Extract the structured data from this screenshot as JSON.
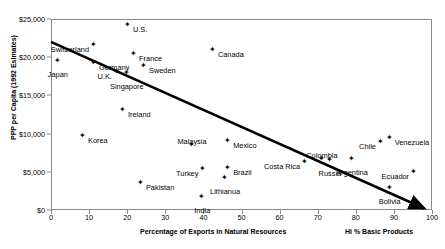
{
  "chart_data": {
    "type": "scatter",
    "title": "",
    "xlabel": "Percentage of Exports in Natural Resources",
    "ylabel": "PPP per Capita (1992 Esimates)",
    "xlim": [
      0,
      100
    ],
    "ylim": [
      0,
      25000
    ],
    "xticks": [
      0,
      10,
      20,
      30,
      40,
      50,
      60,
      70,
      80,
      90,
      100
    ],
    "xtick_labels": [
      "0",
      "10",
      "20",
      "30",
      "40",
      "50",
      "60",
      "70",
      "80",
      "90",
      "100"
    ],
    "yticks": [
      0,
      5000,
      10000,
      15000,
      20000,
      25000
    ],
    "ytick_labels": [
      "$0",
      "$5,000",
      "$10,000",
      "$15,000",
      "$20,000",
      "$25,000"
    ],
    "grid": false,
    "legend": null,
    "annotations": [
      {
        "name": "hi-basic-products-note",
        "text": "Hi % Basic Products",
        "x": 92,
        "y": -2300
      }
    ],
    "trendline": {
      "type": "line-with-arrow",
      "x0": 0,
      "y0": 22000,
      "x1": 98,
      "y1": 200,
      "color": "#000000",
      "width": 2.6
    },
    "points": [
      {
        "label": "Switzerland",
        "x": 11.3,
        "y": 21100,
        "label_pos": "left"
      },
      {
        "label": "Japan",
        "x": 1.8,
        "y": 19000,
        "label_pos": "below"
      },
      {
        "label": "Germany",
        "x": 11.3,
        "y": 18700,
        "label_pos": "right"
      },
      {
        "label": "U.S.",
        "x": 20.2,
        "y": 23700,
        "label_pos": "right"
      },
      {
        "label": "Canada",
        "x": 42.5,
        "y": 20400,
        "label_pos": "right"
      },
      {
        "label": "France",
        "x": 21.8,
        "y": 19900,
        "label_pos": "right"
      },
      {
        "label": "Sweden",
        "x": 24.4,
        "y": 18300,
        "label_pos": "right"
      },
      {
        "label": "U.K.",
        "x": 17.3,
        "y": 17500,
        "label_pos": "left"
      },
      {
        "label": "Singapore",
        "x": 19.9,
        "y": 17400,
        "label_pos": "below"
      },
      {
        "label": "Ireland",
        "x": 18.9,
        "y": 12600,
        "label_pos": "right"
      },
      {
        "label": "Korea",
        "x": 8.4,
        "y": 9200,
        "label_pos": "right"
      },
      {
        "label": "Malaysia",
        "x": 37.0,
        "y": 8000,
        "label_pos": "above"
      },
      {
        "label": "Mexico",
        "x": 46.5,
        "y": 8500,
        "label_pos": "right"
      },
      {
        "label": "Turkey",
        "x": 40.0,
        "y": 4900,
        "label_pos": "left"
      },
      {
        "label": "Brazil",
        "x": 46.5,
        "y": 5000,
        "label_pos": "right"
      },
      {
        "label": "Lithianua",
        "x": 45.7,
        "y": 3700,
        "label_pos": "below"
      },
      {
        "label": "Pakistan",
        "x": 23.6,
        "y": 3000,
        "label_pos": "right"
      },
      {
        "label": "India",
        "x": 39.7,
        "y": 1200,
        "label_pos": "below"
      },
      {
        "label": "Costa Rica",
        "x": 66.7,
        "y": 5800,
        "label_pos": "left"
      },
      {
        "label": "Colombia",
        "x": 71.1,
        "y": 6200,
        "label_pos": "above"
      },
      {
        "label": "Russia",
        "x": 73.2,
        "y": 6000,
        "label_pos": "below"
      },
      {
        "label": "Argentina",
        "x": 79.0,
        "y": 6200,
        "label_pos": "below"
      },
      {
        "label": "Chile",
        "x": 86.6,
        "y": 8400,
        "label_pos": "left"
      },
      {
        "label": "Venezuela",
        "x": 88.9,
        "y": 8900,
        "label_pos": "right"
      },
      {
        "label": "Ecuador",
        "x": 95.3,
        "y": 4500,
        "label_pos": "left"
      },
      {
        "label": "Bolivia",
        "x": 88.9,
        "y": 2400,
        "label_pos": "below"
      }
    ]
  },
  "colors": {
    "marker": "#000000",
    "axis": "#8a8a8a",
    "trend": "#000000",
    "background": "#ffffff"
  }
}
